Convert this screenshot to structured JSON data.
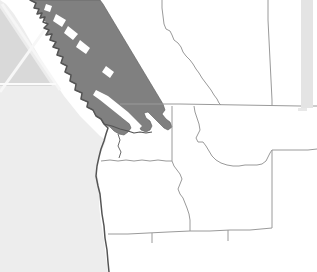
{
  "map": {
    "title": "Pacific Northwest Regional Map",
    "projection_note": "north-up reference map",
    "width": 317,
    "height": 272,
    "colors": {
      "background_land": "#ffffff",
      "ocean": "#ededed",
      "highlight_region": "#808080",
      "highlight_outline": "#5a5a5a",
      "border_line": "#9a9a9a",
      "coastline": "#555555",
      "inset_fill": "#d9d9d9",
      "inset_line": "#f4f4f4",
      "edge_bar": "#e4e4e4"
    },
    "water_bodies": [
      {
        "name": "Pacific Ocean",
        "label": "",
        "fill": "#ededed"
      },
      {
        "name": "Puget Sound",
        "label": "",
        "fill": "#ffffff"
      },
      {
        "name": "Strait of Georgia",
        "label": "",
        "fill": "#ffffff"
      }
    ],
    "highlighted_regions": [
      {
        "name": "British Columbia",
        "label": "",
        "fill": "#808080",
        "state": "selected"
      }
    ],
    "regions": [
      {
        "name": "Washington",
        "label": "",
        "fill": "#ffffff"
      },
      {
        "name": "Oregon",
        "label": "",
        "fill": "#ffffff"
      },
      {
        "name": "Idaho",
        "label": "",
        "fill": "#ffffff"
      },
      {
        "name": "Montana",
        "label": "",
        "fill": "#ffffff"
      },
      {
        "name": "Wyoming",
        "label": "",
        "fill": "#ffffff"
      },
      {
        "name": "Alberta",
        "label": "",
        "fill": "#ffffff"
      },
      {
        "name": "Nevada",
        "label": "",
        "fill": "#ffffff"
      },
      {
        "name": "Utah",
        "label": "",
        "fill": "#ffffff"
      },
      {
        "name": "California",
        "label": "",
        "fill": "#ffffff"
      }
    ],
    "borders": [
      {
        "name": "Canada-United States border (49th parallel)",
        "type": "international"
      },
      {
        "name": "British Columbia - Alberta border",
        "type": "provincial"
      },
      {
        "name": "Washington - Oregon border",
        "type": "state"
      },
      {
        "name": "Washington - Idaho border",
        "type": "state"
      },
      {
        "name": "Oregon - Idaho border",
        "type": "state"
      },
      {
        "name": "Idaho - Montana border",
        "type": "state"
      },
      {
        "name": "Montana - Wyoming border",
        "type": "state"
      },
      {
        "name": "Idaho - Wyoming border",
        "type": "state"
      },
      {
        "name": "Oregon - California border",
        "type": "state"
      },
      {
        "name": "Oregon - Nevada border",
        "type": "state"
      },
      {
        "name": "Idaho - Utah border",
        "type": "state"
      }
    ],
    "inset_graphic": {
      "name": "corner-inset-triangle",
      "description": "triangular corner graphic with diagonal rule"
    },
    "edge_bar": {
      "name": "right-edge-bar",
      "description": "light gray vertical bar along right margin"
    }
  }
}
